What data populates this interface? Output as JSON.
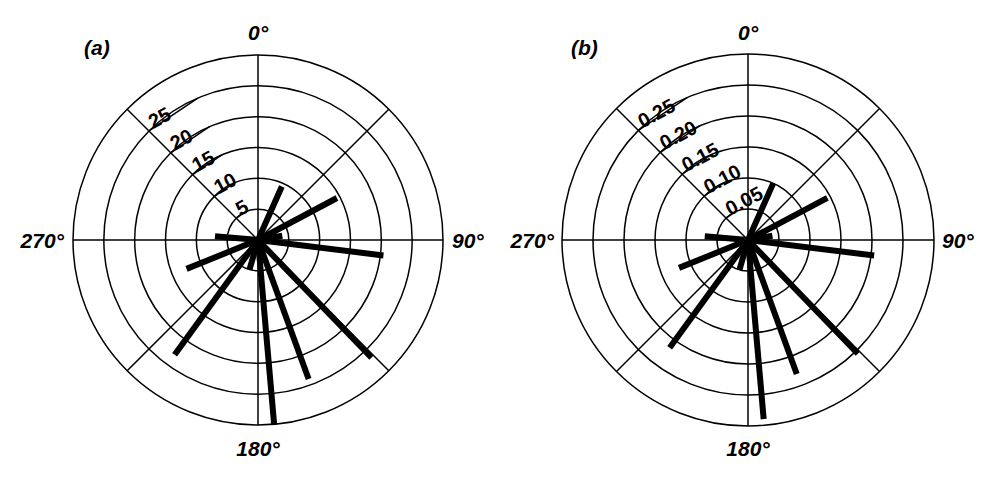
{
  "figure": {
    "background_color": "#ffffff",
    "line_color": "#000000",
    "panel_count": 2
  },
  "panels": [
    {
      "id": "a",
      "label": "(a)",
      "center": {
        "x": 258,
        "y": 240
      },
      "outer_radius": 185,
      "angle_labels": {
        "north": "0°",
        "east": "90°",
        "south": "180°",
        "west": "270°"
      },
      "radial_ticks": [
        "5",
        "10",
        "15",
        "20",
        "25"
      ],
      "radial_tick_values": [
        5,
        10,
        15,
        20,
        25
      ],
      "radial_max": 30,
      "ring_count": 6,
      "spoke_count": 8
    },
    {
      "id": "b",
      "label": "(b)",
      "center": {
        "x": 253,
        "y": 240
      },
      "outer_radius": 186,
      "angle_labels": {
        "north": "0°",
        "east": "90°",
        "south": "180°",
        "west": "270°"
      },
      "radial_ticks": [
        "0.05",
        "0.10",
        "0.15",
        "0.20",
        "0.25"
      ],
      "radial_tick_values": [
        0.05,
        0.1,
        0.15,
        0.2,
        0.25
      ],
      "radial_max": 0.3,
      "ring_count": 6,
      "spoke_count": 8
    }
  ],
  "chart_data": [
    {
      "type": "polar-ray",
      "panel": "a",
      "title": "(a)",
      "xlabel": "Azimuth (degrees clockwise from 0°)",
      "ylabel": "Magnitude",
      "angle_unit": "degrees",
      "angle_zero_at": "north",
      "angle_direction": "clockwise",
      "rlim": [
        0,
        30
      ],
      "r_ticks": [
        5,
        10,
        15,
        20,
        25
      ],
      "r_tick_labels": [
        "5",
        "10",
        "15",
        "20",
        "25"
      ],
      "theta_ticks": [
        0,
        90,
        180,
        270
      ],
      "theta_tick_labels": [
        "0°",
        "90°",
        "180°",
        "270°"
      ],
      "grid": true,
      "grid_rings": 6,
      "grid_spokes": 8,
      "legend": "none",
      "series": [
        {
          "name": "rays",
          "points": [
            {
              "theta": 24,
              "r": 9.5
            },
            {
              "theta": 62,
              "r": 14.5
            },
            {
              "theta": 80,
              "r": 4.0
            },
            {
              "theta": 97,
              "r": 20.5
            },
            {
              "theta": 136,
              "r": 26.5
            },
            {
              "theta": 160,
              "r": 24.0
            },
            {
              "theta": 175,
              "r": 30.0
            },
            {
              "theta": 196,
              "r": 5.0
            },
            {
              "theta": 216,
              "r": 23.0
            },
            {
              "theta": 248,
              "r": 12.5
            },
            {
              "theta": 275,
              "r": 7.0
            }
          ]
        }
      ]
    },
    {
      "type": "polar-ray",
      "panel": "b",
      "title": "(b)",
      "xlabel": "Azimuth (degrees clockwise from 0°)",
      "ylabel": "Magnitude",
      "angle_unit": "degrees",
      "angle_zero_at": "north",
      "angle_direction": "clockwise",
      "rlim": [
        0,
        0.3
      ],
      "r_ticks": [
        0.05,
        0.1,
        0.15,
        0.2,
        0.25
      ],
      "r_tick_labels": [
        "0.05",
        "0.10",
        "0.15",
        "0.20",
        "0.25"
      ],
      "theta_ticks": [
        0,
        90,
        180,
        270
      ],
      "theta_tick_labels": [
        "0°",
        "90°",
        "180°",
        "270°"
      ],
      "grid": true,
      "grid_rings": 6,
      "grid_spokes": 8,
      "legend": "none",
      "series": [
        {
          "name": "rays",
          "points": [
            {
              "theta": 24,
              "r": 0.1
            },
            {
              "theta": 62,
              "r": 0.145
            },
            {
              "theta": 80,
              "r": 0.04
            },
            {
              "theta": 97,
              "r": 0.205
            },
            {
              "theta": 136,
              "r": 0.255
            },
            {
              "theta": 160,
              "r": 0.23
            },
            {
              "theta": 175,
              "r": 0.29
            },
            {
              "theta": 196,
              "r": 0.05
            },
            {
              "theta": 216,
              "r": 0.215
            },
            {
              "theta": 248,
              "r": 0.12
            },
            {
              "theta": 275,
              "r": 0.07
            }
          ]
        }
      ]
    }
  ]
}
